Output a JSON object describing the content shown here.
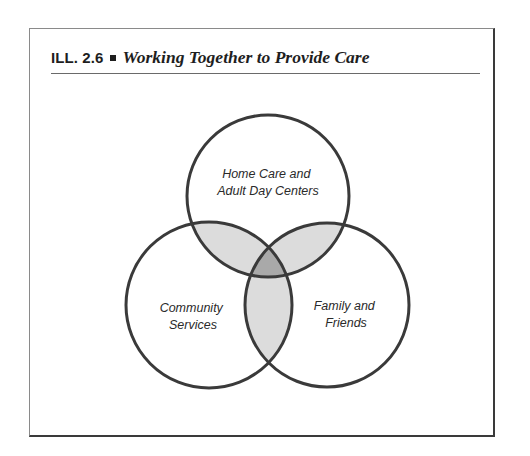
{
  "figure": {
    "label": "ILL. 2.6",
    "bullet_icon": "square-bullet",
    "title": "Working Together to Provide Care"
  },
  "diagram": {
    "type": "venn",
    "colors": {
      "outline": "#3a3a3a",
      "pair_overlap": "#dcdcdc",
      "triple_overlap": "#a9a9a9",
      "background": "#ffffff"
    },
    "sets": [
      {
        "id": "top",
        "label_lines": [
          "Home Care and",
          "Adult Day Centers"
        ]
      },
      {
        "id": "left",
        "label_lines": [
          "Community",
          "Services"
        ]
      },
      {
        "id": "right",
        "label_lines": [
          "Family and",
          "Friends"
        ]
      }
    ]
  }
}
